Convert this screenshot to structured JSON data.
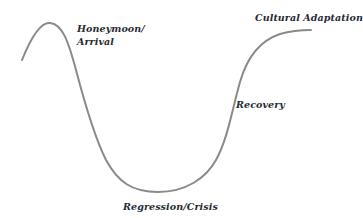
{
  "diagram": {
    "title": "",
    "curve_color": "#8a8a8a",
    "label_color": "#1f2b33",
    "stages": [
      {
        "id": "honeymoon",
        "label_line1": "Honeymoon/",
        "label_line2": "Arrival"
      },
      {
        "id": "regression",
        "label": "Regression/Crisis"
      },
      {
        "id": "recovery",
        "label": "Recovery"
      },
      {
        "id": "adaptation",
        "label": "Cultural Adaptation"
      }
    ]
  }
}
